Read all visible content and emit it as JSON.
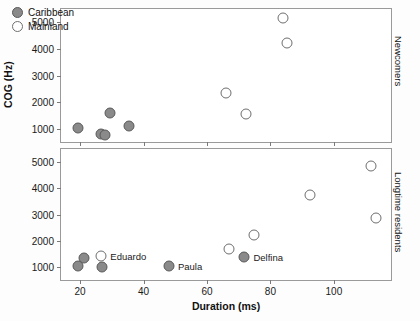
{
  "chart_data": {
    "type": "scatter",
    "title": "",
    "xlabel": "Duration (ms)",
    "ylabel": "COG (Hz)",
    "xlim": [
      14,
      118
    ],
    "ylim": [
      500,
      5500
    ],
    "xticks": [
      20,
      40,
      60,
      80,
      100
    ],
    "yticks": [
      1000,
      2000,
      3000,
      4000,
      5000
    ],
    "grid": false,
    "legend": {
      "position": "top-left",
      "entries": [
        {
          "label": "Caribbean",
          "marker": "filled-circle",
          "color": "#8a8a8a"
        },
        {
          "label": "Mainland",
          "marker": "open-circle",
          "color": "#ffffff"
        }
      ]
    },
    "panels": [
      {
        "strip_label": "Newcomers",
        "series": [
          {
            "name": "Caribbean",
            "points": [
              {
                "x": 19.5,
                "y": 1010
              },
              {
                "x": 26.5,
                "y": 800
              },
              {
                "x": 27.8,
                "y": 750
              },
              {
                "x": 29.3,
                "y": 1600
              },
              {
                "x": 35.5,
                "y": 1090
              }
            ]
          },
          {
            "name": "Mainland",
            "points": [
              {
                "x": 66.0,
                "y": 2340
              },
              {
                "x": 72.2,
                "y": 1540
              },
              {
                "x": 84.0,
                "y": 5170
              },
              {
                "x": 85.2,
                "y": 4230
              }
            ]
          }
        ]
      },
      {
        "strip_label": "Longtime residents",
        "series": [
          {
            "name": "Caribbean",
            "points": [
              {
                "x": 19.2,
                "y": 1040
              },
              {
                "x": 21.2,
                "y": 1330
              },
              {
                "x": 27.0,
                "y": 980
              },
              {
                "x": 48.0,
                "y": 1030,
                "label": "Paula"
              },
              {
                "x": 71.8,
                "y": 1380,
                "label": "Delfina"
              }
            ]
          },
          {
            "name": "Mainland",
            "points": [
              {
                "x": 26.7,
                "y": 1410,
                "label": "Eduardo"
              },
              {
                "x": 66.8,
                "y": 1690
              },
              {
                "x": 74.8,
                "y": 2230
              },
              {
                "x": 92.6,
                "y": 3730
              },
              {
                "x": 111.6,
                "y": 4840
              },
              {
                "x": 113.4,
                "y": 2860
              }
            ]
          }
        ]
      }
    ]
  }
}
